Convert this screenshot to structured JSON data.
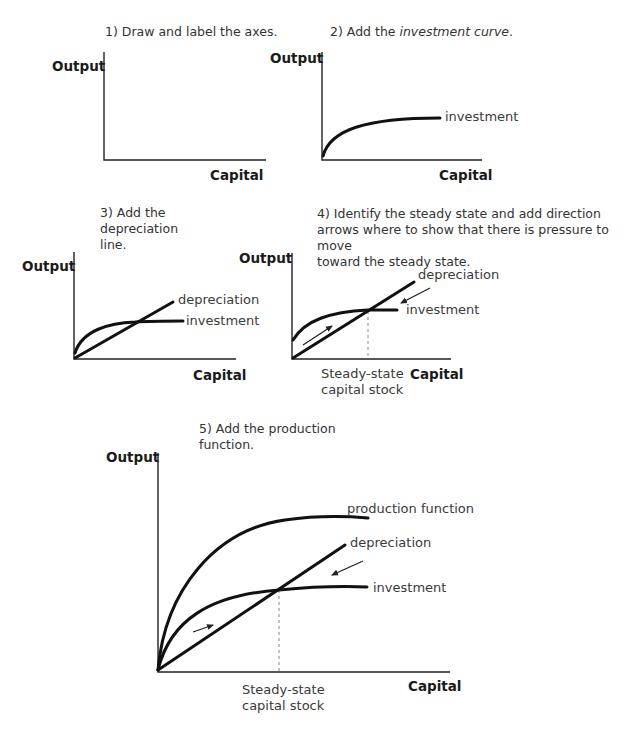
{
  "panels": [
    {
      "id": 1,
      "title": "1) Draw and label the axes.",
      "y_label": "Output",
      "x_label": "Capital",
      "curves": []
    },
    {
      "id": 2,
      "title_prefix": "2) Add the ",
      "title_italic": "investment curve",
      "title_suffix": ".",
      "y_label": "Output",
      "x_label": "Capital",
      "curves": [
        {
          "name": "investment",
          "label": "investment"
        }
      ]
    },
    {
      "id": 3,
      "title_lines": [
        "3) Add the",
        "depreciation",
        "line."
      ],
      "y_label": "Output",
      "x_label": "Capital",
      "curves": [
        {
          "name": "depreciation",
          "label": "depreciation"
        },
        {
          "name": "investment",
          "label": "investment"
        }
      ]
    },
    {
      "id": 4,
      "title_lines": [
        "4) Identify the steady state and add direction",
        "arrows where to show that there is pressure to move",
        "toward the steady state."
      ],
      "y_label": "Output",
      "x_label": "Capital",
      "curves": [
        {
          "name": "depreciation",
          "label": "depreciation"
        },
        {
          "name": "investment",
          "label": "investment"
        }
      ],
      "steady_state_label_lines": [
        "Steady-state",
        "capital stock"
      ]
    },
    {
      "id": 5,
      "title_lines": [
        "5) Add the production",
        "function."
      ],
      "y_label": "Output",
      "x_label": "Capital",
      "curves": [
        {
          "name": "production",
          "label": "production function"
        },
        {
          "name": "depreciation",
          "label": "depreciation"
        },
        {
          "name": "investment",
          "label": "investment"
        }
      ],
      "steady_state_label_lines": [
        "Steady-state",
        "capital stock"
      ]
    }
  ]
}
